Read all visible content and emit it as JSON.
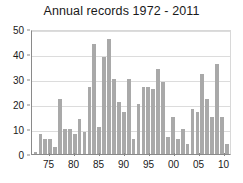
{
  "chart_data": {
    "type": "bar",
    "title": "Annual records 1972 - 2011",
    "xlabel": "",
    "ylabel": "",
    "ylim": [
      0,
      50
    ],
    "yticks": [
      0,
      10,
      20,
      30,
      40,
      50
    ],
    "grid": true,
    "legend": false,
    "bar_color": "#a9a9a9",
    "axis_color": "#8a8a8a",
    "grid_color": "#dcdcdc",
    "background": "#ffffff",
    "xtick_labels": [
      "75",
      "80",
      "85",
      "90",
      "95",
      "00",
      "05",
      "10"
    ],
    "xtick_years": [
      1975,
      1980,
      1985,
      1990,
      1995,
      2000,
      2005,
      2010
    ],
    "categories": [
      1972,
      1973,
      1974,
      1975,
      1976,
      1977,
      1978,
      1979,
      1980,
      1981,
      1982,
      1983,
      1984,
      1985,
      1986,
      1987,
      1988,
      1989,
      1990,
      1991,
      1992,
      1993,
      1994,
      1995,
      1996,
      1997,
      1998,
      1999,
      2000,
      2001,
      2002,
      2003,
      2004,
      2005,
      2006,
      2007,
      2008,
      2009,
      2010,
      2011
    ],
    "values": [
      1,
      8,
      6,
      6,
      3,
      22,
      10,
      10,
      8,
      14,
      9,
      27,
      44,
      11,
      39,
      46,
      30,
      21,
      17,
      30,
      6,
      20,
      27,
      27,
      26,
      34,
      29,
      7,
      15,
      6,
      10,
      4,
      18,
      17,
      32,
      22,
      15,
      36,
      15,
      4
    ]
  }
}
